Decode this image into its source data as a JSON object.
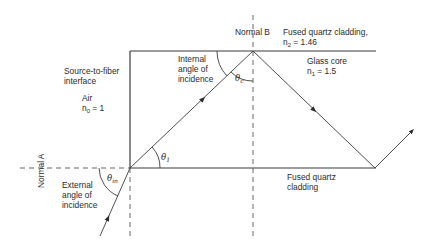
{
  "diagram": {
    "labels": {
      "normal_b": "Normal B",
      "normal_a": "Normal A",
      "cladding_top_line1": "Fused quartz cladding,",
      "cladding_top_n": "n",
      "cladding_top_n_sub": "2",
      "cladding_top_n_val": " = 1.46",
      "core_line1": "Glass core",
      "core_n": "n",
      "core_n_sub": "1",
      "core_n_val": " = 1.5",
      "source_interface_line1": "Source-to-fiber",
      "source_interface_line2": "interface",
      "air_line1": "Air",
      "air_n": "n",
      "air_n_sub": "0",
      "air_n_val": " = 1",
      "internal_angle_line1": "Internal",
      "internal_angle_line2": "angle of",
      "internal_angle_line3": "incidence",
      "external_angle_line1": "External",
      "external_angle_line2": "angle of",
      "external_angle_line3": "incidence",
      "cladding_bottom_line1": "Fused quartz",
      "cladding_bottom_line2": "cladding",
      "theta_c": "θ",
      "theta_c_sub": "c",
      "theta_1": "θ",
      "theta_1_sub": "1",
      "theta_in": "θ",
      "theta_in_sub": "in"
    },
    "media": [
      {
        "name": "Air",
        "n": 1
      },
      {
        "name": "Glass core",
        "n": 1.5
      },
      {
        "name": "Fused quartz cladding",
        "n": 1.46
      }
    ],
    "colors": {
      "line": "#3a3a3a",
      "text": "#2a2a2a"
    }
  }
}
